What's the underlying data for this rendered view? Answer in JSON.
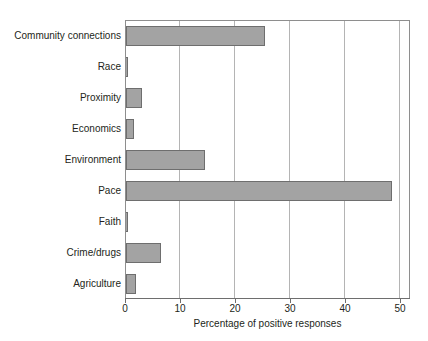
{
  "chart_data": {
    "type": "bar",
    "orientation": "horizontal",
    "title": "",
    "xlabel": "Percentage of positive responses",
    "ylabel": "",
    "xlim": [
      0,
      51.5
    ],
    "xticks": [
      0,
      10,
      20,
      30,
      40,
      50
    ],
    "xtick_labels": [
      "0",
      "10",
      "20",
      "30",
      "40",
      "50"
    ],
    "grid": "vertical",
    "legend": "none",
    "bar_color": "#a3a3a3",
    "bar_edge_color": "#6e6e6e",
    "categories": [
      "Community connections",
      "Race",
      "Proximity",
      "Economics",
      "Environment",
      "Pace",
      "Faith",
      "Crime/drugs",
      "Agriculture"
    ],
    "values": [
      25.3,
      0.3,
      2.9,
      1.4,
      14.4,
      48.4,
      0.3,
      6.4,
      1.9
    ],
    "series": [
      {
        "name": "Percentage of positive responses",
        "values": [
          25.3,
          0.3,
          2.9,
          1.4,
          14.4,
          48.4,
          0.3,
          6.4,
          1.9
        ]
      }
    ]
  }
}
